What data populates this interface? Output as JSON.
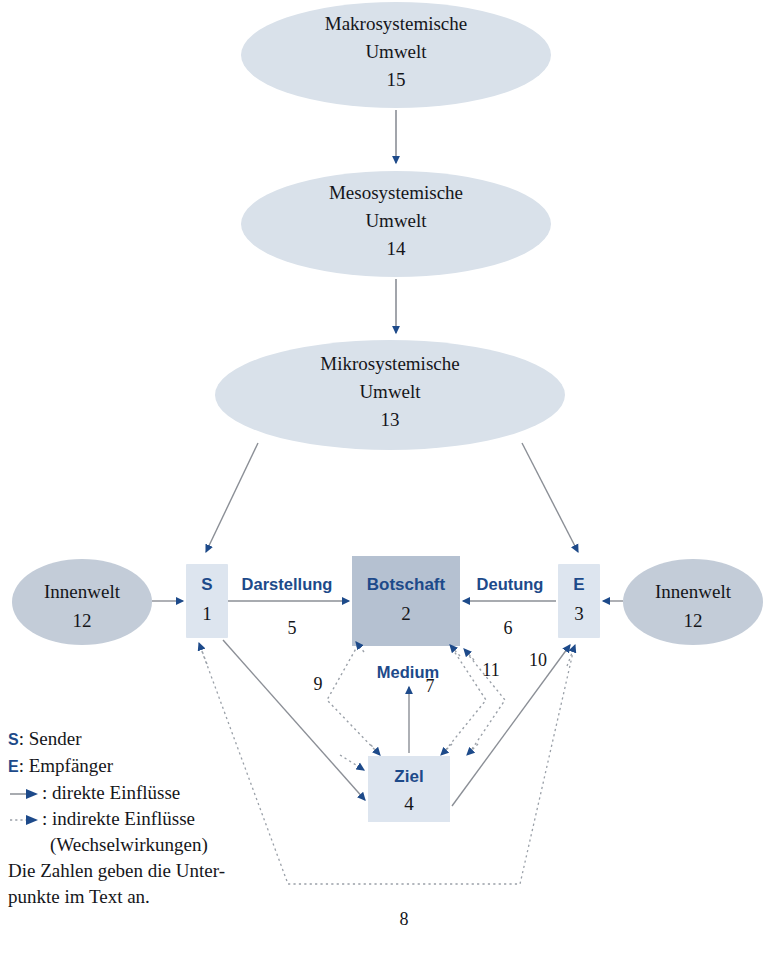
{
  "diagram": {
    "title_chain": [
      "Makrosystemische",
      "Mesosystemische",
      "Mikrosystemische"
    ],
    "ellipses": [
      {
        "id": "makro",
        "label_line1": "Makrosystemische",
        "label_line2": "Umwelt",
        "number": "15"
      },
      {
        "id": "meso",
        "label_line1": "Mesosystemische",
        "label_line2": "Umwelt",
        "number": "14"
      },
      {
        "id": "mikro",
        "label_line1": "Mikrosystemische",
        "label_line2": "Umwelt",
        "number": "13"
      },
      {
        "id": "innen_left",
        "label_line1": "Innenwelt",
        "label_line2": "",
        "number": "12"
      },
      {
        "id": "innen_right",
        "label_line1": "Innenwelt",
        "label_line2": "",
        "number": "12"
      }
    ],
    "boxes": [
      {
        "id": "sender",
        "code": "S",
        "number": "1"
      },
      {
        "id": "botschaft",
        "code": "Botschaft",
        "number": "2"
      },
      {
        "id": "empfaenger",
        "code": "E",
        "number": "3"
      },
      {
        "id": "ziel",
        "code": "Ziel",
        "number": "4"
      }
    ],
    "edge_labels": [
      {
        "id": "darstellung",
        "text": "Darstellung"
      },
      {
        "id": "deutung",
        "text": "Deutung"
      },
      {
        "id": "medium",
        "text": "Medium"
      }
    ],
    "edge_numbers": [
      {
        "id": "n5",
        "text": "5"
      },
      {
        "id": "n6",
        "text": "6"
      },
      {
        "id": "n7",
        "text": "7"
      },
      {
        "id": "n8",
        "text": "8"
      },
      {
        "id": "n9",
        "text": "9"
      },
      {
        "id": "n10",
        "text": "10"
      },
      {
        "id": "n11",
        "text": "11"
      }
    ]
  },
  "legend": {
    "sender_key": "S",
    "sender_text": ": Sender",
    "empfaenger_key": "E",
    "empfaenger_text": ": Empfänger",
    "direct_text": ": direkte Einflüsse",
    "indirect_text": ": indirekte Einflüsse",
    "indirect_text2": "(Wechselwirkungen)",
    "note_line1": "Die Zahlen geben die Unter-",
    "note_line2": "punkte im Text an."
  },
  "colors": {
    "ellipse_fill_outer": "#d9e1ea",
    "ellipse_fill_inner": "#c3ccd8",
    "box_fill_light": "#dde5ef",
    "box_fill_dark": "#b5c1d1",
    "accent_blue": "#1d4a8a",
    "arrow_blue": "#1d4a8a",
    "line_gray": "#8b8f96",
    "text_black": "#15161a",
    "background": "#ffffff"
  }
}
